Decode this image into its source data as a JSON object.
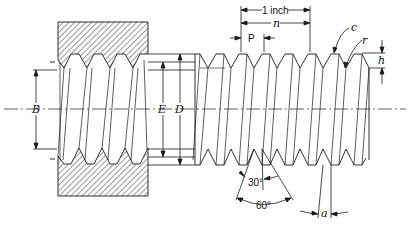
{
  "labels": {
    "one_inch": "1 inch",
    "n": "n",
    "pitch": "P",
    "crest": "c",
    "root": "r",
    "thread_depth": "h",
    "minor_diameter_nut": "B",
    "pitch_diameter": "E",
    "major_diameter": "D",
    "flank_angle": "30°",
    "thread_angle": "60°",
    "lead_angle": "a"
  },
  "colors": {
    "line": "#1a1a1a",
    "background": "#ffffff"
  }
}
